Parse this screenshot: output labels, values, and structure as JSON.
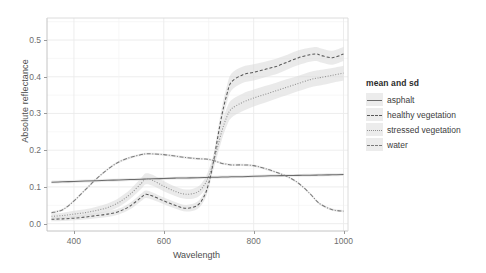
{
  "chart_data": {
    "type": "line",
    "title": "",
    "xlabel": "Wavelength",
    "ylabel": "Absolute reflectance",
    "xlim": [
      340,
      1010
    ],
    "ylim": [
      -0.02,
      0.56
    ],
    "xticks": [
      "400",
      "600",
      "800",
      "1000"
    ],
    "xtick_values": [
      400,
      600,
      800,
      1000
    ],
    "yticks": [
      "0.0",
      "0.1",
      "0.2",
      "0.3",
      "0.4",
      "0.5"
    ],
    "ytick_values": [
      0.0,
      0.1,
      0.2,
      0.3,
      0.4,
      0.5
    ],
    "grid": true,
    "legend_position": "right",
    "legend_title": "mean and sd",
    "x": [
      350,
      375,
      400,
      425,
      450,
      475,
      500,
      525,
      550,
      560,
      575,
      600,
      625,
      650,
      675,
      690,
      700,
      710,
      720,
      730,
      740,
      750,
      775,
      800,
      825,
      850,
      875,
      900,
      925,
      940,
      950,
      975,
      1000
    ],
    "series": [
      {
        "name": "asphalt",
        "linestyle": "solid",
        "color": "#6b6b6b",
        "values": [
          0.113,
          0.114,
          0.115,
          0.116,
          0.117,
          0.118,
          0.119,
          0.12,
          0.121,
          0.1215,
          0.122,
          0.123,
          0.124,
          0.1245,
          0.125,
          0.1255,
          0.126,
          0.1262,
          0.1265,
          0.1268,
          0.127,
          0.1275,
          0.128,
          0.129,
          0.13,
          0.1305,
          0.131,
          0.1315,
          0.132,
          0.1322,
          0.1325,
          0.133,
          0.134
        ],
        "sd": [
          0.004,
          0.004,
          0.004,
          0.004,
          0.004,
          0.004,
          0.004,
          0.004,
          0.004,
          0.004,
          0.004,
          0.004,
          0.004,
          0.004,
          0.004,
          0.004,
          0.004,
          0.004,
          0.004,
          0.004,
          0.004,
          0.004,
          0.004,
          0.004,
          0.004,
          0.004,
          0.004,
          0.004,
          0.004,
          0.004,
          0.004,
          0.004,
          0.004
        ]
      },
      {
        "name": "healthy vegetation",
        "linestyle": "dashed",
        "color": "#585858",
        "values": [
          0.012,
          0.013,
          0.015,
          0.018,
          0.022,
          0.026,
          0.033,
          0.048,
          0.072,
          0.08,
          0.075,
          0.062,
          0.05,
          0.042,
          0.05,
          0.075,
          0.11,
          0.165,
          0.235,
          0.3,
          0.35,
          0.385,
          0.405,
          0.412,
          0.42,
          0.428,
          0.44,
          0.452,
          0.46,
          0.462,
          0.458,
          0.452,
          0.462
        ],
        "sd": [
          0.006,
          0.006,
          0.006,
          0.007,
          0.007,
          0.008,
          0.008,
          0.009,
          0.01,
          0.01,
          0.01,
          0.009,
          0.009,
          0.009,
          0.01,
          0.012,
          0.014,
          0.017,
          0.02,
          0.022,
          0.023,
          0.023,
          0.022,
          0.022,
          0.021,
          0.021,
          0.02,
          0.02,
          0.019,
          0.019,
          0.019,
          0.019,
          0.019
        ]
      },
      {
        "name": "stressed vegetation",
        "linestyle": "dotted",
        "color": "#8f8f8f",
        "values": [
          0.02,
          0.022,
          0.026,
          0.03,
          0.036,
          0.044,
          0.058,
          0.08,
          0.11,
          0.122,
          0.118,
          0.102,
          0.088,
          0.08,
          0.086,
          0.105,
          0.13,
          0.165,
          0.21,
          0.255,
          0.29,
          0.312,
          0.33,
          0.342,
          0.352,
          0.362,
          0.372,
          0.382,
          0.392,
          0.396,
          0.398,
          0.404,
          0.41
        ],
        "sd": [
          0.008,
          0.008,
          0.009,
          0.009,
          0.01,
          0.011,
          0.012,
          0.013,
          0.015,
          0.015,
          0.015,
          0.014,
          0.013,
          0.013,
          0.014,
          0.015,
          0.017,
          0.019,
          0.021,
          0.023,
          0.024,
          0.024,
          0.024,
          0.023,
          0.023,
          0.022,
          0.022,
          0.021,
          0.021,
          0.021,
          0.021,
          0.02,
          0.02
        ]
      },
      {
        "name": "water",
        "linestyle": "dashdot",
        "color": "#7a7a7a",
        "values": [
          0.03,
          0.038,
          0.062,
          0.092,
          0.122,
          0.148,
          0.168,
          0.18,
          0.188,
          0.19,
          0.19,
          0.188,
          0.184,
          0.18,
          0.177,
          0.176,
          0.175,
          0.172,
          0.168,
          0.164,
          0.162,
          0.16,
          0.16,
          0.158,
          0.15,
          0.14,
          0.128,
          0.11,
          0.082,
          0.062,
          0.052,
          0.038,
          0.034
        ],
        "sd": [
          0.003,
          0.003,
          0.003,
          0.003,
          0.003,
          0.003,
          0.003,
          0.003,
          0.003,
          0.003,
          0.003,
          0.003,
          0.003,
          0.003,
          0.003,
          0.003,
          0.003,
          0.003,
          0.003,
          0.003,
          0.003,
          0.003,
          0.003,
          0.003,
          0.003,
          0.003,
          0.003,
          0.003,
          0.003,
          0.003,
          0.003,
          0.003,
          0.003
        ]
      }
    ]
  },
  "legend": {
    "title": "mean and sd",
    "items": [
      {
        "label": "asphalt"
      },
      {
        "label": "healthy vegetation"
      },
      {
        "label": "stressed vegetation"
      },
      {
        "label": "water"
      }
    ]
  }
}
